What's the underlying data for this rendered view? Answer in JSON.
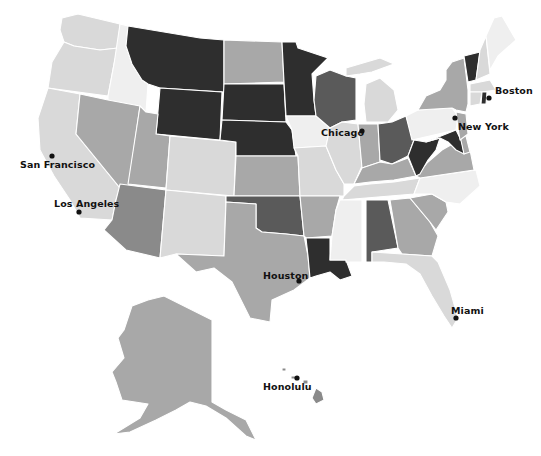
{
  "legend_shades": {
    "very_light": "#efefef",
    "light": "#d9d9d9",
    "light_mid": "#c8c8c8",
    "mid": "#a8a8a8",
    "mid_dark": "#8a8a8a",
    "dark": "#5a5a5a",
    "very_dark": "#2e2e2e"
  },
  "cities": [
    {
      "name": "San Francisco",
      "label": "San Francisco"
    },
    {
      "name": "Los Angeles",
      "label": "Los Angeles"
    },
    {
      "name": "Chicago",
      "label": "Chicago"
    },
    {
      "name": "Boston",
      "label": "Boston"
    },
    {
      "name": "New York",
      "label": "New York"
    },
    {
      "name": "Houston",
      "label": "Houston"
    },
    {
      "name": "Miami",
      "label": "Miami"
    },
    {
      "name": "Honolulu",
      "label": "Honolulu"
    }
  ],
  "states": {
    "WA": "light",
    "OR": "light",
    "CA": "light",
    "ID": "very_light",
    "NV": "mid",
    "MT": "very_dark",
    "WY": "very_dark",
    "UT": "mid",
    "AZ": "mid_dark",
    "CO": "light",
    "NM": "light",
    "ND": "mid",
    "SD": "very_dark",
    "NE": "very_dark",
    "KS": "mid",
    "OK": "dark",
    "TX": "mid",
    "MN": "very_dark",
    "IA": "very_light",
    "MO": "light",
    "AR": "mid",
    "LA": "very_dark",
    "WI": "dark",
    "IL": "light",
    "MI": "light",
    "IN": "mid",
    "OH": "dark",
    "KY": "mid",
    "TN": "light",
    "MS": "very_light",
    "AL": "dark",
    "GA": "mid",
    "FL": "light",
    "SC": "mid",
    "NC": "very_light",
    "VA": "mid",
    "WV": "very_dark",
    "MD": "very_dark",
    "DE": "mid",
    "PA": "very_light",
    "NJ": "mid",
    "NY": "mid",
    "VT": "very_dark",
    "NH": "light",
    "ME": "very_light",
    "MA": "light",
    "CT": "light",
    "RI": "very_dark",
    "AK": "mid",
    "HI": "mid_dark"
  }
}
